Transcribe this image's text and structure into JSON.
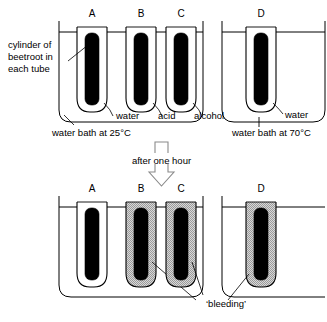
{
  "figure": {
    "ink_color": "#000000",
    "background_color": "#ffffff",
    "bleeding_fill_color": "#b8b8b8",
    "beetroot_color": "#000000"
  },
  "labels": {
    "beetroot_label": "cylinder of beetroot in each tube",
    "beetroot_label_line1": "cylinder of",
    "beetroot_label_line2": "beetroot in",
    "beetroot_label_line3": "each tube",
    "water_bath_cold": "water bath at 25°C",
    "water_bath_hot": "water bath at 70°C",
    "transition": "after one hour",
    "bleeding": "‘bleeding’"
  },
  "top_row": {
    "caption_left": "water bath at 25°C",
    "caption_right": "water bath at 70°C",
    "tubes": [
      {
        "letter": "A",
        "liquid": "water",
        "bleeding": false
      },
      {
        "letter": "B",
        "liquid": "acid",
        "bleeding": false
      },
      {
        "letter": "C",
        "liquid": "alcohol",
        "bleeding": false
      },
      {
        "letter": "D",
        "liquid": "water",
        "bleeding": false
      }
    ]
  },
  "bottom_row": {
    "tubes": [
      {
        "letter": "A",
        "bleeding": false
      },
      {
        "letter": "B",
        "bleeding": true
      },
      {
        "letter": "C",
        "bleeding": true
      },
      {
        "letter": "D",
        "bleeding": true
      }
    ],
    "annotation": "‘bleeding’"
  }
}
